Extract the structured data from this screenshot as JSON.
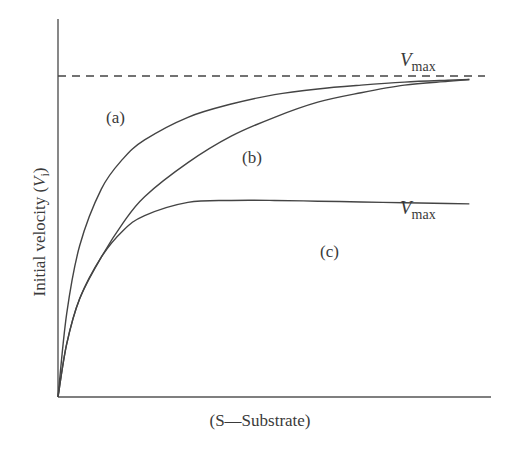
{
  "chart_data": {
    "type": "line",
    "title": "",
    "xlabel": "(S—Substrate)",
    "ylabel_main": "Initial velocity (",
    "ylabel_var": "V",
    "ylabel_sub": "i",
    "ylabel_close": ")",
    "xlim": [
      0,
      100
    ],
    "ylim": [
      0,
      100
    ],
    "grid": false,
    "legend": "none (curves labeled inline)",
    "reference_lines": [
      {
        "name": "Vmax (a, b)",
        "y": 85,
        "style": "dashed",
        "x_end": 98
      }
    ],
    "annotations": [
      {
        "text": "V",
        "sub": "max",
        "for": "upper asymptote (a, b)"
      },
      {
        "text": "V",
        "sub": "max",
        "for": "curve c plateau"
      }
    ],
    "series": [
      {
        "name": "(a)",
        "label": "(a)",
        "x": [
          0,
          2,
          5,
          10,
          15,
          20,
          30,
          40,
          50,
          60,
          70,
          80,
          90,
          95
        ],
        "y": [
          0,
          22,
          40,
          55,
          63,
          68,
          74,
          77.5,
          80,
          81.5,
          82.5,
          83.3,
          83.8,
          84
        ]
      },
      {
        "name": "(b)",
        "label": "(b)",
        "x": [
          0,
          2,
          5,
          10,
          15,
          20,
          30,
          40,
          50,
          60,
          70,
          80,
          90,
          95
        ],
        "y": [
          0,
          14,
          26,
          37,
          46,
          53,
          62,
          69,
          74,
          78,
          80.5,
          82.5,
          83.5,
          84
        ]
      },
      {
        "name": "(c)",
        "label": "(c)",
        "x": [
          0,
          2,
          5,
          10,
          15,
          20,
          30,
          40,
          50,
          60,
          70,
          80,
          90,
          95
        ],
        "y": [
          0,
          14,
          26,
          37,
          44,
          48,
          51.5,
          52,
          52,
          51.8,
          51.6,
          51.4,
          51.2,
          51.1
        ]
      }
    ]
  },
  "labels": {
    "a": "(a)",
    "b": "(b)",
    "c": "(c)",
    "vmax_var": "V",
    "vmax_sub": "max"
  }
}
